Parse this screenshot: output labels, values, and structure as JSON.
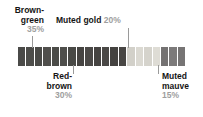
{
  "chart_data": {
    "type": "bar",
    "orientation": "horizontal-stacked",
    "title": "",
    "xlabel": "",
    "ylabel": "",
    "categories": [
      "Brown-green",
      "Red-brown",
      "Muted gold",
      "Muted mauve"
    ],
    "values": [
      35,
      30,
      20,
      15
    ],
    "unit": "%",
    "total": 100,
    "grid": false,
    "legend": "callout-labels",
    "segment_count": 20,
    "segments": [
      {
        "group": "Brown-green",
        "color": "#4a4a48"
      },
      {
        "group": "Brown-green",
        "color": "#4d4d4a"
      },
      {
        "group": "Brown-green",
        "color": "#4a4a47"
      },
      {
        "group": "Brown-green",
        "color": "#504f4c"
      },
      {
        "group": "Brown-green",
        "color": "#4b4b48"
      },
      {
        "group": "Brown-green",
        "color": "#4e4e4b"
      },
      {
        "group": "Brown-green",
        "color": "#494946"
      },
      {
        "group": "Red-brown",
        "color": "#464442"
      },
      {
        "group": "Red-brown",
        "color": "#4b4947"
      },
      {
        "group": "Red-brown",
        "color": "#454341"
      },
      {
        "group": "Red-brown",
        "color": "#4a4846"
      },
      {
        "group": "Red-brown",
        "color": "#444240"
      },
      {
        "group": "Red-brown",
        "color": "#484644"
      },
      {
        "group": "Muted gold",
        "color": "#d2d0c9"
      },
      {
        "group": "Muted gold",
        "color": "#dbd9d2"
      },
      {
        "group": "Muted gold",
        "color": "#d5d3cc"
      },
      {
        "group": "Muted gold",
        "color": "#dedcd5"
      },
      {
        "group": "Muted mauve",
        "color": "#747272"
      },
      {
        "group": "Muted mauve",
        "color": "#7c7a7a"
      },
      {
        "group": "Muted mauve",
        "color": "#767474"
      }
    ]
  },
  "callouts": {
    "brown_green": {
      "name_line1": "Brown-",
      "name_line2": "green",
      "percent": "35%"
    },
    "muted_gold": {
      "name": "Muted gold",
      "percent": "20%"
    },
    "red_brown": {
      "name_line1": "Red-",
      "name_line2": "brown",
      "percent": "30%"
    },
    "muted_mauve": {
      "name_line1": "Muted",
      "name_line2": "mauve",
      "percent": "15%"
    }
  },
  "colors": {
    "label_text": "#141414",
    "percent_text": "#9e9e9e",
    "leader_line": "#9a9a9a",
    "background": "#ffffff"
  }
}
